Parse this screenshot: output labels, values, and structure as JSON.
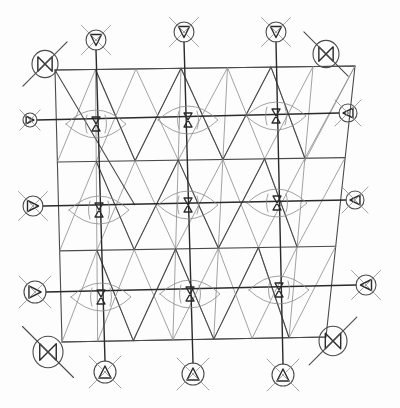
{
  "diagram": {
    "description": "Hand-drawn pencil sketch of a square lattice with triangular subdivisions, nine eye-shaped nodes with hourglass glyphs, and circled crossed-out symbols around the perimeter",
    "colors": {
      "paper": "#fdfdfd",
      "pencil_dark": "#2a2a2a",
      "pencil_mid": "#4a4a4a",
      "pencil_light": "#8a8a8a"
    },
    "frame": {
      "tl": [
        55,
        70
      ],
      "tr": [
        355,
        66
      ],
      "br": [
        326,
        337
      ],
      "bl": [
        62,
        342
      ]
    },
    "vertical_axes_x": [
      96,
      188,
      275
    ],
    "horizontal_axes_y": [
      122,
      205,
      295
    ],
    "sub_lines_y": [
      70,
      162,
      250,
      340
    ],
    "eye_nodes": [
      {
        "id": "eye-1-1",
        "cx": 96,
        "cy": 124,
        "glyph": "hourglass"
      },
      {
        "id": "eye-1-2",
        "cx": 188,
        "cy": 120,
        "glyph": "hourglass"
      },
      {
        "id": "eye-1-3",
        "cx": 276,
        "cy": 116,
        "glyph": "hourglass"
      },
      {
        "id": "eye-2-1",
        "cx": 99,
        "cy": 210,
        "glyph": "hourglass"
      },
      {
        "id": "eye-2-2",
        "cx": 188,
        "cy": 205,
        "glyph": "hourglass"
      },
      {
        "id": "eye-2-3",
        "cx": 277,
        "cy": 203,
        "glyph": "hourglass"
      },
      {
        "id": "eye-3-1",
        "cx": 101,
        "cy": 297,
        "glyph": "hourglass"
      },
      {
        "id": "eye-3-2",
        "cx": 190,
        "cy": 294,
        "glyph": "hourglass"
      },
      {
        "id": "eye-3-3",
        "cx": 279,
        "cy": 290,
        "glyph": "hourglass"
      }
    ],
    "corner_symbols": [
      {
        "id": "corner-top-left",
        "cx": 45,
        "cy": 64,
        "r": 13,
        "glyph": "bowtie",
        "slash": "rising"
      },
      {
        "id": "corner-top-right",
        "cx": 326,
        "cy": 54,
        "r": 13,
        "glyph": "bowtie",
        "slash": "falling"
      },
      {
        "id": "corner-bottom-left",
        "cx": 48,
        "cy": 352,
        "r": 15,
        "glyph": "bowtie",
        "slash": "falling"
      },
      {
        "id": "corner-bottom-right",
        "cx": 333,
        "cy": 341,
        "r": 14,
        "glyph": "bowtie",
        "slash": "rising"
      }
    ],
    "edge_symbols": [
      {
        "id": "top-1",
        "cx": 96,
        "cy": 40,
        "r": 10,
        "glyph": "triangle-down"
      },
      {
        "id": "top-2",
        "cx": 184,
        "cy": 32,
        "r": 10,
        "glyph": "triangle-down"
      },
      {
        "id": "top-3",
        "cx": 276,
        "cy": 32,
        "r": 10,
        "glyph": "triangle-down"
      },
      {
        "id": "left-1",
        "cx": 30,
        "cy": 120,
        "r": 7,
        "glyph": "triangle-right"
      },
      {
        "id": "left-2",
        "cx": 33,
        "cy": 206,
        "r": 10,
        "glyph": "triangle-right"
      },
      {
        "id": "left-3",
        "cx": 35,
        "cy": 292,
        "r": 11,
        "glyph": "triangle-right"
      },
      {
        "id": "right-1",
        "cx": 348,
        "cy": 113,
        "r": 9,
        "glyph": "triangle-left"
      },
      {
        "id": "right-2",
        "cx": 355,
        "cy": 200,
        "r": 9,
        "glyph": "triangle-left"
      },
      {
        "id": "right-3",
        "cx": 366,
        "cy": 285,
        "r": 10,
        "glyph": "triangle-left"
      },
      {
        "id": "bottom-1",
        "cx": 105,
        "cy": 372,
        "r": 11,
        "glyph": "triangle-up"
      },
      {
        "id": "bottom-2",
        "cx": 193,
        "cy": 374,
        "r": 11,
        "glyph": "triangle-up"
      },
      {
        "id": "bottom-3",
        "cx": 283,
        "cy": 375,
        "r": 11,
        "glyph": "triangle-up"
      }
    ]
  }
}
